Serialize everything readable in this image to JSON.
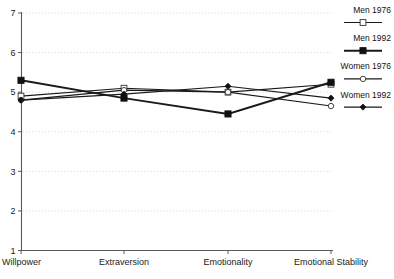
{
  "chart_data": {
    "type": "line",
    "title": "",
    "xlabel": "",
    "ylabel": "",
    "categories": [
      "Willpower",
      "Extraversion",
      "Emotionality",
      "Emotional Stability"
    ],
    "ylim": [
      1,
      7
    ],
    "yticks": [
      1,
      2,
      3,
      4,
      5,
      6,
      7
    ],
    "ytick_labels": [
      "1",
      "2",
      "3",
      "4",
      "5",
      "6",
      "7"
    ],
    "grid": true,
    "grid_axis": "y",
    "legend_position": "right",
    "series": [
      {
        "name": "Men 1976",
        "marker": "open-square",
        "color": "#1a1a1a",
        "values": [
          4.9,
          5.1,
          5.0,
          5.2
        ]
      },
      {
        "name": "Men 1992",
        "marker": "filled-square",
        "color": "#1a1a1a",
        "values": [
          5.3,
          4.85,
          4.45,
          5.25
        ]
      },
      {
        "name": "Women 1976",
        "marker": "open-circle",
        "color": "#1a1a1a",
        "values": [
          4.8,
          5.05,
          5.0,
          4.65
        ]
      },
      {
        "name": "Women 1992",
        "marker": "filled-diamond",
        "color": "#1a1a1a",
        "values": [
          4.8,
          4.95,
          5.15,
          4.85
        ]
      }
    ]
  },
  "legend": {
    "entries": [
      {
        "label": "Men 1976"
      },
      {
        "label": "Men 1992"
      },
      {
        "label": "Women 1976"
      },
      {
        "label": "Women 1992"
      }
    ]
  },
  "axis": {
    "y_tick_labels": [
      "7",
      "6",
      "5",
      "4",
      "3",
      "2",
      "1"
    ],
    "x_tick_labels": [
      "Willpower",
      "Extraversion",
      "Emotionality",
      "Emotional Stability"
    ]
  },
  "colors": {
    "line": "#1a1a1a",
    "axis": "#4a4a4a",
    "grid": "#c9c9c9",
    "background": "#ffffff"
  }
}
